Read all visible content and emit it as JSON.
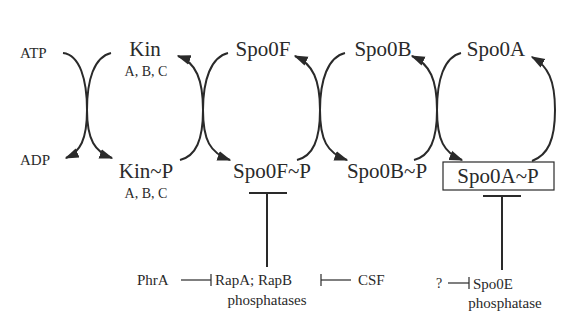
{
  "diagram": {
    "type": "phosphorelay-pathway",
    "nodes": {
      "atp": "ATP",
      "adp": "ADP",
      "kin": "Kin",
      "kin_sub": "A, B, C",
      "kin_p": "Kin~P",
      "kin_p_sub": "A, B, C",
      "spo0f": "Spo0F",
      "spo0f_p": "Spo0F~P",
      "spo0b": "Spo0B",
      "spo0b_p": "Spo0B~P",
      "spo0a": "Spo0A",
      "spo0a_p": "Spo0A~P"
    },
    "regulators": {
      "phra": "PhrA",
      "rap": "RapA; RapB",
      "rap_sub": "phosphatases",
      "csf": "CSF",
      "unknown": "?",
      "spo0e": "Spo0E",
      "spo0e_sub": "phosphatase"
    },
    "edges": [
      {
        "from": "ATP",
        "to": "ADP",
        "type": "coupled-reaction"
      },
      {
        "from": "Kin",
        "to": "Kin~P",
        "type": "phosphorylation"
      },
      {
        "from": "Kin~P",
        "to": "Kin",
        "type": "phosphotransfer"
      },
      {
        "from": "Spo0F",
        "to": "Spo0F~P",
        "type": "phosphotransfer"
      },
      {
        "from": "Spo0F~P",
        "to": "Spo0F",
        "type": "phosphotransfer"
      },
      {
        "from": "Spo0B",
        "to": "Spo0B~P",
        "type": "phosphotransfer"
      },
      {
        "from": "Spo0B~P",
        "to": "Spo0B",
        "type": "phosphotransfer"
      },
      {
        "from": "Spo0A",
        "to": "Spo0A~P",
        "type": "phosphotransfer"
      },
      {
        "from": "Spo0A~P",
        "to": "Spo0A",
        "type": "dephosphorylation"
      },
      {
        "from": "RapA; RapB phosphatases",
        "to": "Spo0F~P",
        "type": "inhibition"
      },
      {
        "from": "PhrA",
        "to": "RapA; RapB phosphatases",
        "type": "inhibition"
      },
      {
        "from": "CSF",
        "to": "RapA; RapB phosphatases",
        "type": "inhibition"
      },
      {
        "from": "Spo0E phosphatase",
        "to": "Spo0A~P",
        "type": "inhibition"
      },
      {
        "from": "?",
        "to": "Spo0E phosphatase",
        "type": "inhibition"
      }
    ],
    "highlighted_node": "Spo0A~P"
  }
}
